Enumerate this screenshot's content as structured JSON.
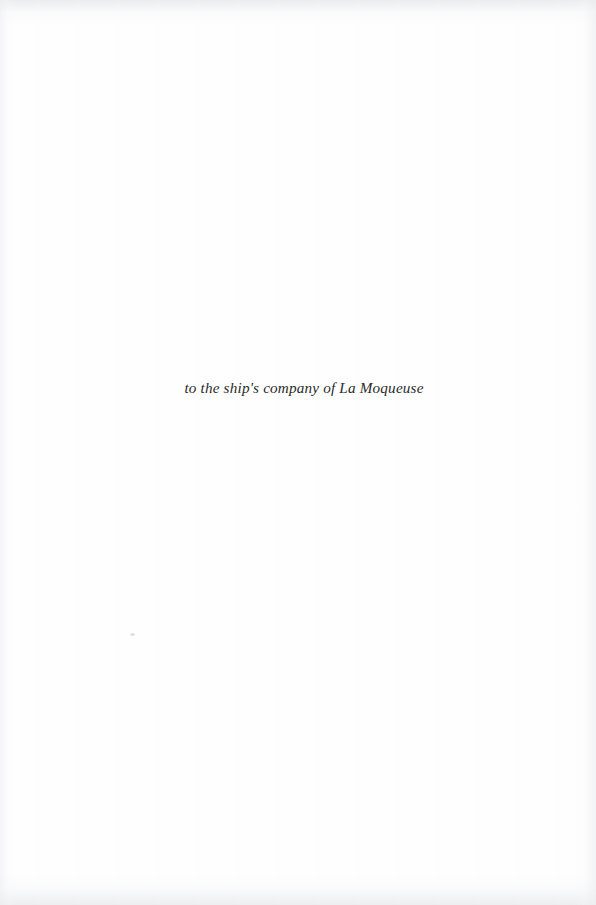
{
  "page": {
    "width": 596,
    "height": 905,
    "background_color": "#fefefe",
    "kind": "book-dedication-page"
  },
  "dedication": {
    "text": "to the ship's company of La Moqueuse",
    "style": "italic",
    "color": "#2a2a2a",
    "alignment": "center"
  },
  "artifacts": {
    "dust_speck_label": "",
    "edge_shading_label": "",
    "banding_label": ""
  }
}
